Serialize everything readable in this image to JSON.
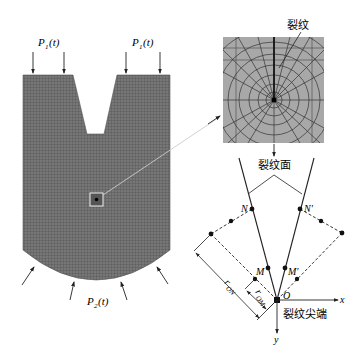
{
  "loads": {
    "top_left": "P",
    "top_left_sub": "1",
    "top_left_arg": "(t)",
    "top_right": "P",
    "top_right_sub": "1",
    "top_right_arg": "(t)",
    "bottom": "P",
    "bottom_sub": "2",
    "bottom_arg": "(t)"
  },
  "inset": {
    "crack_label": "裂纹"
  },
  "crack_diagram": {
    "crack_face_label": "裂纹面",
    "crack_tip_label": "裂纹尖端",
    "point_N": "N",
    "point_N_prime": "N'",
    "point_M": "M",
    "point_M_prime": "M'",
    "origin": "O",
    "x_axis": "x",
    "y_axis": "y",
    "r_ON": "r",
    "r_ON_sub": "ON",
    "r_OM": "r",
    "r_OM_sub": "OM"
  },
  "colors": {
    "mesh_fill": "#6e6e6e",
    "inset_fill": "#a9a9a9",
    "line": "#222222"
  }
}
